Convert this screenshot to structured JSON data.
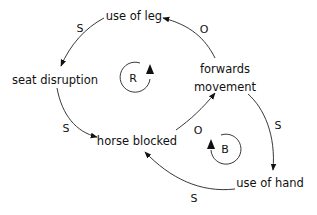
{
  "diagram": {
    "type": "causal-loop-diagram",
    "nodes": {
      "use_of_leg": "use of leg",
      "seat_disruption": "seat disruption",
      "horse_blocked": "horse blocked",
      "forwards_movement_line1": "forwards",
      "forwards_movement_line2": "movement",
      "use_of_hand": "use of hand"
    },
    "links": [
      {
        "from": "use of leg",
        "to": "seat disruption",
        "polarity": "S"
      },
      {
        "from": "seat disruption",
        "to": "horse blocked",
        "polarity": "S"
      },
      {
        "from": "horse blocked",
        "to": "forwards movement",
        "polarity": "O"
      },
      {
        "from": "forwards movement",
        "to": "use of leg",
        "polarity": "O"
      },
      {
        "from": "forwards movement",
        "to": "use of hand",
        "polarity": "S"
      },
      {
        "from": "use of hand",
        "to": "horse blocked",
        "polarity": "S"
      }
    ],
    "loops": [
      {
        "label": "R",
        "meaning": "reinforcing"
      },
      {
        "label": "B",
        "meaning": "balancing"
      }
    ],
    "colors": {
      "ink": "#111111",
      "background": "#ffffff"
    }
  }
}
